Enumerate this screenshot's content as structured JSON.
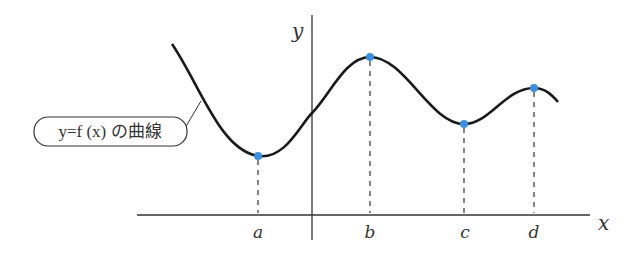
{
  "figure": {
    "curve_label": "y=f (x) の曲線",
    "axes": {
      "x_label": "x",
      "y_label": "y"
    },
    "points": [
      {
        "name": "a",
        "label": "a"
      },
      {
        "name": "b",
        "label": "b"
      },
      {
        "name": "c",
        "label": "c"
      },
      {
        "name": "d",
        "label": "d"
      }
    ],
    "colors": {
      "curve": "#1a1a1a",
      "point": "#3a8fe0",
      "axis": "#333333"
    }
  }
}
